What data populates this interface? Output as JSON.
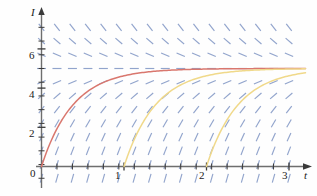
{
  "figure": {
    "caption": "",
    "background_color": "#fefefe"
  },
  "axes": {
    "x_axis_label": "t",
    "y_axis_label": "I",
    "origin_label": "0",
    "x_ticks": [
      {
        "value": 1,
        "label": "1"
      },
      {
        "value": 2,
        "label": "2"
      },
      {
        "value": 3,
        "label": "3"
      }
    ],
    "y_ticks": [
      {
        "value": 2,
        "label": "2"
      },
      {
        "value": 4,
        "label": "4"
      },
      {
        "value": 6,
        "label": "6"
      }
    ],
    "axis_color": "#6e6e6e",
    "tick_color": "#3a3a3a"
  },
  "chart_data": {
    "type": "line",
    "title": "",
    "xlabel": "t",
    "ylabel": "I",
    "xlim": [
      -0.07,
      3.25
    ],
    "ylim": [
      -0.85,
      7.4
    ],
    "grid": false,
    "legend": "none",
    "annotations": [
      {
        "text": "equilibrium solution I = 5",
        "y": 5
      }
    ],
    "slope_field": {
      "description": "direction field of dI/dt = k(5 - I), dashes drawn on a lattice; slope positive below I=5, negative above I=5, horizontal at I=5",
      "color": "#7f95c4",
      "equilibrium": 5,
      "x_samples": [
        0,
        0.1875,
        0.375,
        0.5625,
        0.75,
        0.9375,
        1.125,
        1.3125,
        1.5,
        1.6875,
        1.875,
        2.0625,
        2.25,
        2.4375,
        2.625,
        2.8125,
        3.0
      ],
      "y_samples": [
        -0.6,
        0.1,
        0.8,
        1.5,
        2.2,
        2.9,
        3.6,
        4.3,
        5.0,
        5.7,
        6.4,
        7.1
      ]
    },
    "series": [
      {
        "name": "solution through (0, 0)",
        "color": "#d9776e",
        "start_t": 0,
        "equilibrium": 5,
        "rate": 2.6,
        "x": [
          0.0,
          0.15,
          0.3,
          0.45,
          0.6,
          0.75,
          0.9,
          1.05,
          1.2,
          1.5,
          1.8,
          2.1,
          2.4,
          2.7,
          3.0
        ],
        "values": [
          0.0,
          1.61,
          2.71,
          3.46,
          3.97,
          4.3,
          4.53,
          4.68,
          4.78,
          4.9,
          4.96,
          4.98,
          4.99,
          5.0,
          5.0
        ]
      },
      {
        "name": "solution through (1, 0)",
        "color": "#f0d98a",
        "start_t": 1,
        "equilibrium": 5,
        "rate": 2.6,
        "x": [
          1.0,
          1.15,
          1.3,
          1.45,
          1.6,
          1.75,
          1.9,
          2.05,
          2.2,
          2.5,
          2.8,
          3.0
        ],
        "values": [
          0.0,
          1.61,
          2.71,
          3.46,
          3.97,
          4.3,
          4.53,
          4.68,
          4.78,
          4.9,
          4.96,
          4.98
        ]
      },
      {
        "name": "solution through (2, 0)",
        "color": "#f0d98a",
        "start_t": 2,
        "equilibrium": 5,
        "rate": 2.6,
        "x": [
          2.0,
          2.15,
          2.3,
          2.45,
          2.6,
          2.75,
          2.9,
          3.0
        ],
        "values": [
          0.0,
          1.61,
          2.71,
          3.46,
          3.97,
          4.3,
          4.53,
          4.63
        ]
      }
    ]
  }
}
